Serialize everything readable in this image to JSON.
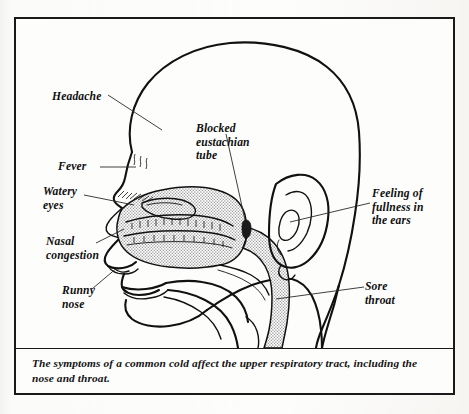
{
  "figure": {
    "kind": "medical-illustration",
    "caption": "The symptoms of a common cold affect the upper respiratory tract, including the nose and throat."
  },
  "labels": {
    "headache": "Headache",
    "fever": "Fever",
    "watery_eyes": "Watery\neyes",
    "nasal_congestion": "Nasal\ncongestion",
    "runny_nose": "Runny\nnose",
    "blocked_eustachian_tube": "Blocked\neustachian\ntube",
    "fullness_in_ears": "Feeling of\nfullness in\nthe ears",
    "sore_throat": "Sore\nthroat"
  },
  "colors": {
    "ink": "#111111",
    "page": "#fbfbf9",
    "panel": "#fdfdfc",
    "shaded_mucosa": "#a9a9a9",
    "leader_line": "#2a2a2a"
  }
}
